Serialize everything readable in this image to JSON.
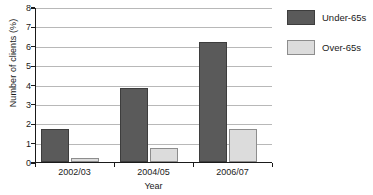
{
  "chart_data": {
    "type": "bar",
    "title": "",
    "xlabel": "Year",
    "ylabel": "Number of clients (%)",
    "categories": [
      "2002/03",
      "2004/05",
      "2006/07"
    ],
    "series": [
      {
        "name": "Under-65s",
        "color": "#5a5a5a",
        "values": [
          1.7,
          3.8,
          6.2
        ]
      },
      {
        "name": "Over-65s",
        "color": "#dcdcdc",
        "values": [
          0.2,
          0.7,
          1.7
        ]
      }
    ],
    "ylim": [
      0,
      8
    ],
    "ytick_labels": [
      "0",
      "1",
      "2",
      "3",
      "4",
      "5",
      "6",
      "7",
      "8"
    ],
    "ytick_values": [
      0,
      1,
      2,
      3,
      4,
      5,
      6,
      7,
      8
    ],
    "grid": "horizontal",
    "legend_position": "right"
  }
}
